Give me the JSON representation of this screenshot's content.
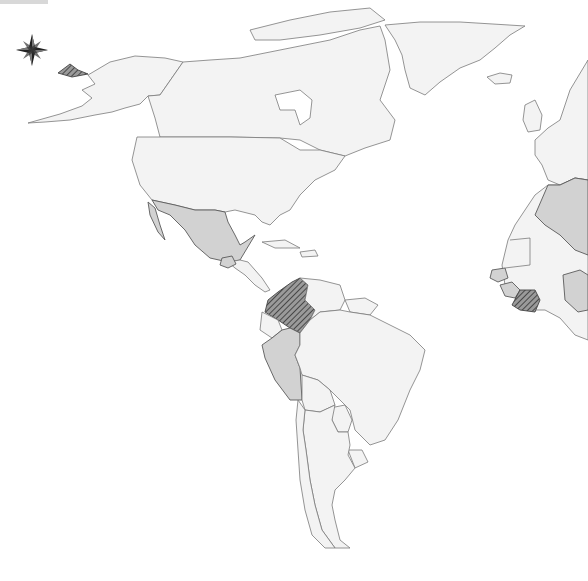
{
  "map": {
    "projection": "world-map-americas-atlantic",
    "style": "grayscale choropleth",
    "colors": {
      "background": "#ffffff",
      "land_default": "#f3f3f3",
      "category_medium": "#d2d2d2",
      "category_hatched": "#555555",
      "border": "#7a7a7a"
    },
    "legend_categories": [
      {
        "name": "default",
        "fill": "#f3f3f3"
      },
      {
        "name": "shaded",
        "fill": "#d2d2d2"
      },
      {
        "name": "hatched",
        "fill": "hatched-dark"
      }
    ],
    "shaded_regions": [
      "Mexico",
      "Guatemala",
      "Peru",
      "Algeria",
      "Senegal",
      "Guinea",
      "Nigeria"
    ],
    "hatched_regions": [
      "Colombia",
      "Côte d'Ivoire",
      "Chukotka (Russia)"
    ],
    "compass": {
      "icon": "compass-rose-icon"
    }
  }
}
